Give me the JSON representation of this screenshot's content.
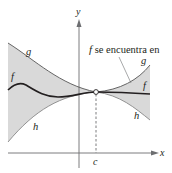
{
  "figure": {
    "axes": {
      "x_label": "x",
      "y_label": "y"
    },
    "point_label": "c",
    "annotation": {
      "italic_part": "f",
      "text": " se encuentra en"
    },
    "curve_labels": {
      "g_left": "g",
      "f_left": "f",
      "h_left": "h",
      "g_right": "g",
      "f_right": "f",
      "h_right": "h"
    },
    "colors": {
      "shade": "#d9d9d9",
      "curve": "#231f20",
      "bound": "#555555",
      "axis": "#6d6e71"
    }
  }
}
